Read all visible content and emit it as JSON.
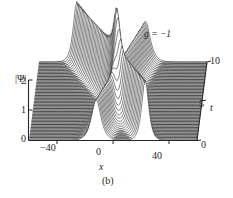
{
  "figure": {
    "caption": "(b)",
    "annotation": "g = −1",
    "background": "#ffffff",
    "line_color": "#1c1c1c",
    "axis_color": "#262626"
  },
  "axes": {
    "y": {
      "label": "|Ψ|",
      "ticks": [
        "0",
        "1",
        "2"
      ],
      "range": [
        0,
        2.4
      ]
    },
    "x": {
      "label": "x",
      "ticks": [
        "−40",
        "0",
        "40"
      ],
      "range": [
        -60,
        60
      ]
    },
    "t": {
      "label": "t",
      "ticks": [
        "0",
        "5",
        "10"
      ],
      "range": [
        0,
        10
      ]
    }
  },
  "chart_data": {
    "type": "line",
    "title": "",
    "subtitle": "",
    "xlabel": "x",
    "ylabel": "|Ψ|",
    "zlabel": "t",
    "grid": false,
    "legend": null,
    "annotations": [
      {
        "text": "g = −1",
        "x": 25,
        "t": 9.0
      },
      {
        "text": "(b)",
        "x": 0,
        "t": -1
      }
    ],
    "xlim": [
      -60,
      60
    ],
    "ylim": [
      0,
      2.4
    ],
    "tlim": [
      0,
      10
    ],
    "projection": "waterfall-3d",
    "n_traces": 55,
    "solitons": [
      {
        "name": "soliton-left",
        "amplitude": 2.0,
        "width": 2.2,
        "x_at_t0": 23,
        "x_at_t10": -33,
        "velocity": -5.6
      },
      {
        "name": "soliton-right",
        "amplitude": 1.35,
        "width": 3.0,
        "x_at_t0": -12,
        "x_at_t10": 16,
        "velocity": 2.8
      }
    ],
    "series": [
      {
        "name": "t=0",
        "t": 0,
        "peaks": [
          {
            "x": 23,
            "a": 2.0
          },
          {
            "x": -12,
            "a": 1.35
          }
        ]
      },
      {
        "name": "t=2",
        "t": 2,
        "peaks": [
          {
            "x": 11.8,
            "a": 2.0
          },
          {
            "x": -6.4,
            "a": 1.35
          }
        ]
      },
      {
        "name": "t=4",
        "t": 4,
        "peaks": [
          {
            "x": 0.6,
            "a": 2.0
          },
          {
            "x": -0.8,
            "a": 1.35
          }
        ]
      },
      {
        "name": "t=5",
        "t": 5,
        "peaks": [
          {
            "x": -5.0,
            "a": 2.2
          }
        ]
      },
      {
        "name": "t=6",
        "t": 6,
        "peaks": [
          {
            "x": -10.6,
            "a": 2.0
          },
          {
            "x": 4.8,
            "a": 1.35
          }
        ]
      },
      {
        "name": "t=8",
        "t": 8,
        "peaks": [
          {
            "x": -21.8,
            "a": 2.0
          },
          {
            "x": 10.4,
            "a": 1.35
          }
        ]
      },
      {
        "name": "t=10",
        "t": 10,
        "peaks": [
          {
            "x": -33,
            "a": 2.0
          },
          {
            "x": 16,
            "a": 1.35
          }
        ]
      }
    ]
  }
}
